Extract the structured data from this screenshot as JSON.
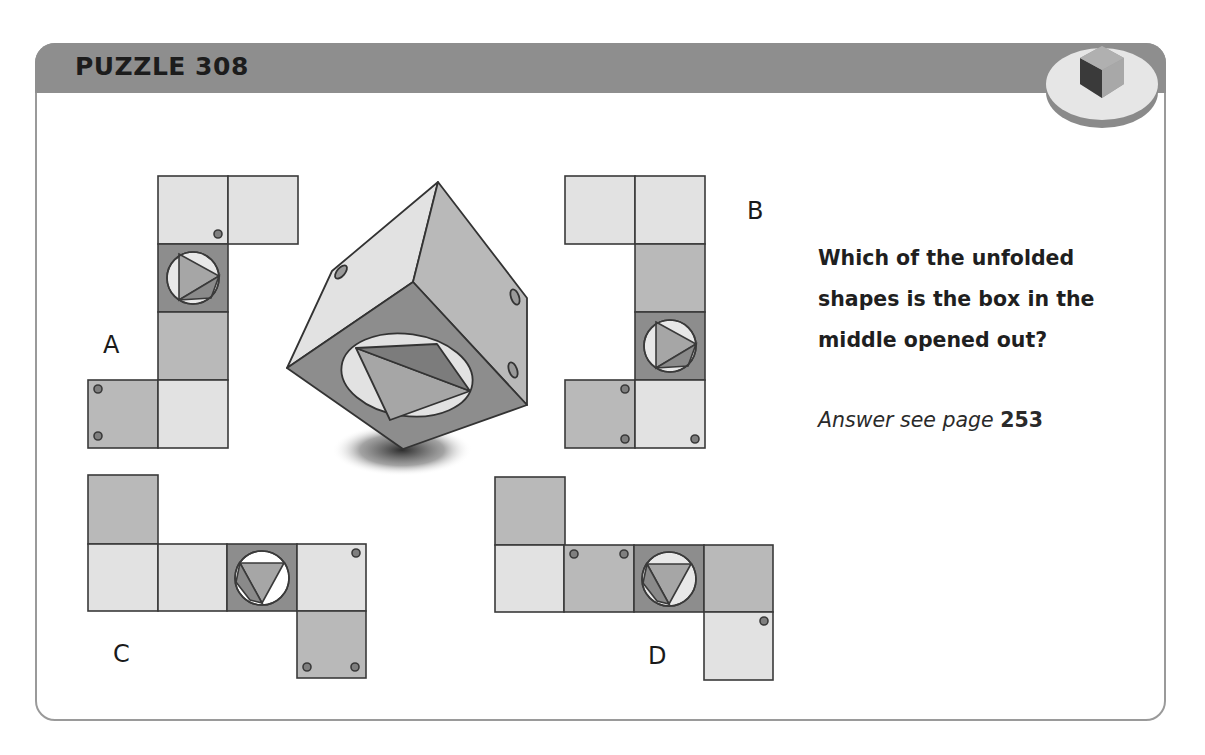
{
  "header": {
    "title": "PUZZLE 308",
    "badge_icon": "cube-icon"
  },
  "question": {
    "text": "Which of the unfolded shapes is the box in the middle opened out?",
    "lines": [
      "Which of the unfolded",
      "shapes is the box in the",
      "middle opened out?"
    ]
  },
  "answer": {
    "prefix": "Answer see page",
    "page": "253"
  },
  "options": [
    {
      "label": "A"
    },
    {
      "label": "B"
    },
    {
      "label": "C"
    },
    {
      "label": "D"
    }
  ],
  "colors": {
    "header": "#8e8e8e",
    "face_light": "#e2e2e2",
    "face_medium": "#b9b9b9",
    "face_dark": "#8d8d8d",
    "dot": "#7f7f7f",
    "outline": "#3a3a3a"
  }
}
